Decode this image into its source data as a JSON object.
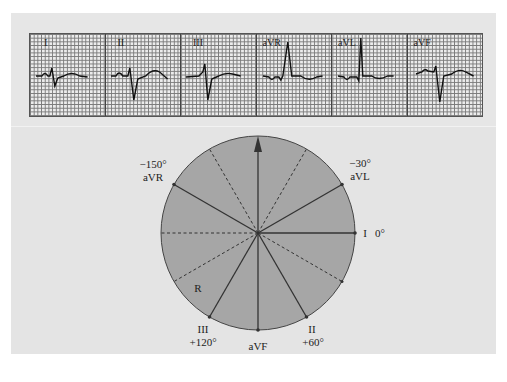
{
  "ecg_strip": {
    "leads": [
      {
        "label": "I"
      },
      {
        "label": "II"
      },
      {
        "label": "III"
      },
      {
        "label": "aVR"
      },
      {
        "label": "aVL"
      },
      {
        "label": "aVF"
      }
    ]
  },
  "hexaxial": {
    "arrow_direction": "up",
    "labels": {
      "avr_angle": "−150°",
      "avr_name": "aVR",
      "avl_angle": "−30°",
      "avl_name": "aVL",
      "lead_i_name": "I",
      "lead_i_angle": "0°",
      "lead_ii_name": "II",
      "lead_ii_angle": "+60°",
      "lead_iii_name": "III",
      "lead_iii_angle": "+120°",
      "avf_name": "aVF",
      "region_label": "R"
    },
    "colors": {
      "circle_fill": "#a6a6a6",
      "circle_stroke": "#444444",
      "background": "#e4e4e4"
    }
  }
}
